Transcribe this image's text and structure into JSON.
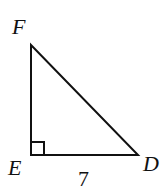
{
  "diagram": {
    "type": "right-triangle",
    "vertices": [
      {
        "name": "F",
        "x": 31,
        "y": 45,
        "label_x": 12,
        "label_y": 34
      },
      {
        "name": "E",
        "x": 31,
        "y": 155,
        "label_x": 8,
        "label_y": 175
      },
      {
        "name": "D",
        "x": 138,
        "y": 155,
        "label_x": 143,
        "label_y": 171
      }
    ],
    "right_angle_at": "E",
    "side_labels": [
      {
        "side": "ED",
        "text": "7",
        "x": 78,
        "y": 186
      }
    ],
    "stroke_color": "#111111"
  }
}
